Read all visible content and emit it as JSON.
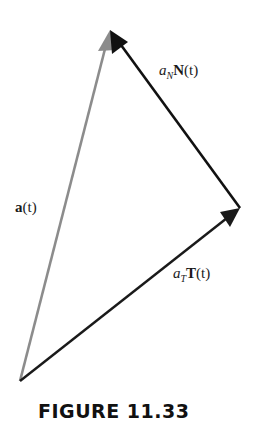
{
  "diagram": {
    "vectors": [
      {
        "id": "a",
        "label_main": "a",
        "label_arg": "(t)",
        "from": [
          20,
          381
        ],
        "to": [
          110,
          30
        ],
        "color": "#8c8c8c"
      },
      {
        "id": "aT",
        "label_coef": "a",
        "label_sub": "T",
        "label_vec": "T",
        "label_arg": "(t)",
        "from": [
          20,
          381
        ],
        "to": [
          240,
          208
        ],
        "color": "#1a1a1a"
      },
      {
        "id": "aN",
        "label_coef": "a",
        "label_sub": "N",
        "label_vec": "N",
        "label_arg": "(t)",
        "from": [
          240,
          208
        ],
        "to": [
          110,
          30
        ],
        "color": "#111111"
      }
    ],
    "labels": {
      "a_vec": {
        "bold": "a",
        "rest": "(t)"
      },
      "aN": {
        "coef": "a",
        "sub": "N",
        "vec": "N",
        "arg": "(t)"
      },
      "aT": {
        "coef": "a",
        "sub": "T",
        "vec": "T",
        "arg": "(t)"
      }
    },
    "caption": "FIGURE 11.33"
  }
}
